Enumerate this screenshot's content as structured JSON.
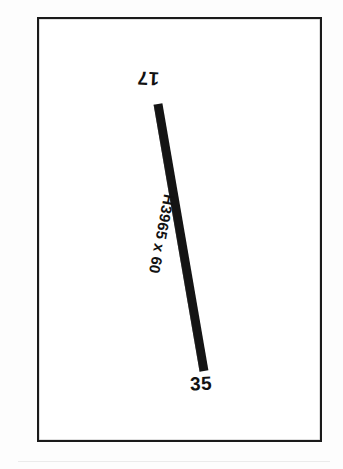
{
  "sheet": {
    "width": 343,
    "height": 469,
    "background_color": "#fdfdfd",
    "paper_color": "#ffffff"
  },
  "frame": {
    "name": "drawing-border",
    "stroke_color": "#1a1a1a",
    "stroke_width_px": 2.5,
    "x": 37,
    "y": 17,
    "width": 285,
    "height": 425
  },
  "drawing": {
    "type": "structural-member-elevation",
    "fill_color": "#141414",
    "member": {
      "label": "H3965 x 60",
      "thickness_px": 9,
      "start": {
        "x": 158,
        "y": 104
      },
      "end": {
        "x": 204,
        "y": 371
      }
    },
    "nodes": [
      {
        "id": "top",
        "label": "17",
        "x": 152,
        "y": 80,
        "rotation_deg": 183
      },
      {
        "id": "bottom",
        "label": "35",
        "x": 200,
        "y": 383,
        "rotation_deg": -2
      }
    ]
  },
  "labels": {
    "node_top": "17",
    "node_bottom": "35",
    "member_tag": "H3965 x 60"
  }
}
